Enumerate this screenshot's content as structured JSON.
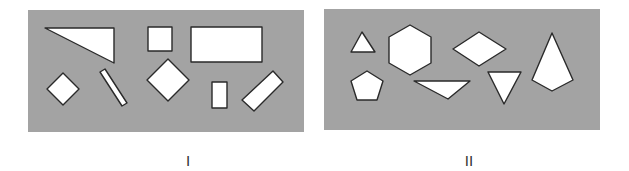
{
  "figure": {
    "colors": {
      "panel_bg": "#a3a3a3",
      "shape_fill": "#ffffff",
      "shape_stroke": "#2a2a2a",
      "label_color": "#333333"
    },
    "panels": [
      {
        "id": "I",
        "label": "I",
        "rect": {
          "x": 28,
          "y": 10,
          "w": 276,
          "h": 122
        },
        "label_pos": {
          "x": 188,
          "y": 162
        },
        "shapes": [
          {
            "name": "right-triangle",
            "points": "45,28 114,28 114,63"
          },
          {
            "name": "small-square",
            "points": "148,27 172,27 172,51 148,51"
          },
          {
            "name": "wide-rectangle",
            "points": "191,27 262,27 262,62 191,62"
          },
          {
            "name": "small-diamond",
            "points": "63,73 79,89 63,105 47,89"
          },
          {
            "name": "thin-bar",
            "points": "100,72 105,69 127,103 122,106"
          },
          {
            "name": "large-diamond",
            "points": "168,59 189,80 168,101 147,80"
          },
          {
            "name": "small-rectangle",
            "points": "212,82 227,82 227,108 212,108"
          },
          {
            "name": "tilted-rectangle",
            "points": "242,100 273,71 283,82 254,111"
          }
        ]
      },
      {
        "id": "II",
        "label": "II",
        "rect": {
          "x": 324,
          "y": 9,
          "w": 276,
          "h": 121
        },
        "label_pos": {
          "x": 469,
          "y": 162
        },
        "shapes": [
          {
            "name": "small-triangle",
            "points": "362,32 375,52 351,52"
          },
          {
            "name": "hexagon",
            "points": "410,25 431,37 431,63 410,75 389,63 389,37"
          },
          {
            "name": "rhombus",
            "points": "479,32 506,49 479,66 453,49"
          },
          {
            "name": "pentagon",
            "points": "367,71 383,81 377,100 357,100 351,81"
          },
          {
            "name": "wide-triangle",
            "points": "414,81 470,81 448,99"
          },
          {
            "name": "down-triangle",
            "points": "488,72 521,72 504,104"
          },
          {
            "name": "kite",
            "points": "552,33 573,80 552,91 532,80"
          }
        ]
      }
    ]
  }
}
